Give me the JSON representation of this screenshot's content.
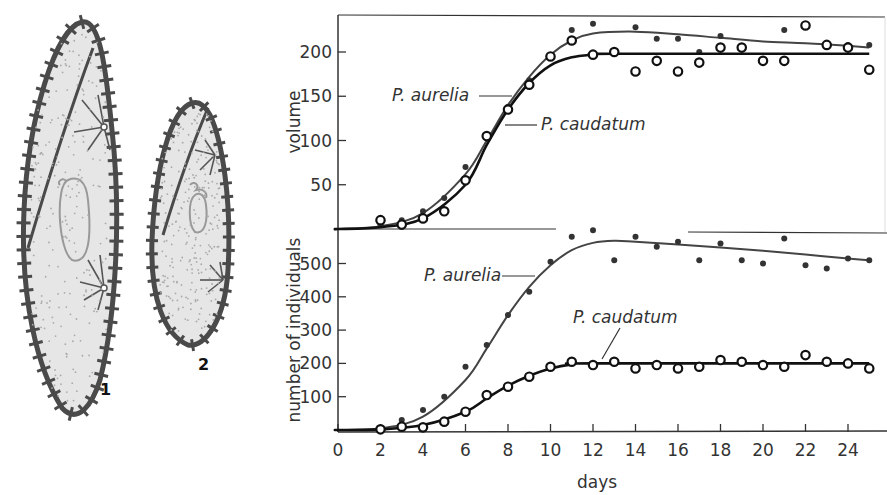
{
  "figure": {
    "organisms": [
      {
        "number_label": "1",
        "name": "P. caudatum (larger)"
      },
      {
        "number_label": "2",
        "name": "P. aurelia (smaller)"
      }
    ],
    "colors": {
      "aurelia_line": "#444444",
      "caudatum_line": "#111111",
      "axis": "#333333",
      "cell_fill": "#e4e4e4",
      "cell_outline": "#4a4a4a"
    }
  },
  "chart_data": [
    {
      "type": "line",
      "panel": "top",
      "title": "",
      "xlabel": "",
      "ylabel": "volume",
      "yticks": [
        50,
        100,
        150,
        200
      ],
      "xlim": [
        0,
        25.5
      ],
      "ylim": [
        0,
        240
      ],
      "grid": false,
      "series": [
        {
          "name": "P. aurelia",
          "marker": "filled-dot",
          "x": [
            2,
            3,
            4,
            5,
            6,
            7,
            8,
            9,
            10,
            11,
            12,
            14,
            15,
            16,
            17,
            18,
            19,
            21,
            22,
            24,
            25
          ],
          "values": [
            5,
            10,
            20,
            35,
            70,
            105,
            138,
            168,
            195,
            225,
            232,
            228,
            215,
            215,
            200,
            218,
            205,
            225,
            230,
            208,
            208
          ],
          "fit_curve": {
            "x": [
              0,
              2,
              4,
              6,
              7,
              8,
              9,
              10,
              11,
              12,
              14,
              16,
              18,
              20,
              22,
              24,
              25
            ],
            "y": [
              0,
              3,
              18,
              62,
              100,
              140,
              172,
              197,
              213,
              221,
              223,
              220,
              216,
              212,
              210,
              207,
              205
            ]
          }
        },
        {
          "name": "P. caudatum",
          "marker": "open-circle",
          "x": [
            2,
            3,
            4,
            5,
            6,
            7,
            8,
            9,
            10,
            11,
            12,
            13,
            14,
            15,
            16,
            17,
            18,
            19,
            20,
            21,
            22,
            23,
            24,
            25
          ],
          "values": [
            10,
            5,
            12,
            20,
            55,
            105,
            135,
            163,
            195,
            213,
            197,
            200,
            178,
            190,
            178,
            188,
            205,
            205,
            190,
            190,
            230,
            208,
            205,
            180
          ],
          "fit_curve": {
            "x": [
              0,
              2,
              4,
              6,
              7,
              8,
              9,
              10,
              11,
              12,
              13,
              25
            ],
            "y": [
              0,
              2,
              12,
              50,
              95,
              135,
              165,
              185,
              194,
              197,
              198,
              198
            ]
          }
        }
      ]
    },
    {
      "type": "line",
      "panel": "bottom",
      "title": "",
      "xlabel": "days",
      "ylabel": "number of individuals",
      "xticks": [
        0,
        2,
        4,
        6,
        8,
        10,
        12,
        14,
        16,
        18,
        20,
        22,
        24
      ],
      "yticks": [
        100,
        200,
        300,
        400,
        500
      ],
      "xlim": [
        0,
        25.5
      ],
      "ylim": [
        0,
        600
      ],
      "grid": false,
      "series": [
        {
          "name": "P. aurelia",
          "marker": "filled-dot",
          "x": [
            2,
            3,
            4,
            5,
            6,
            7,
            8,
            9,
            10,
            11,
            12,
            13,
            14,
            15,
            16,
            17,
            18,
            19,
            20,
            21,
            22,
            23,
            24,
            25
          ],
          "values": [
            5,
            30,
            60,
            100,
            190,
            255,
            345,
            415,
            505,
            580,
            600,
            510,
            580,
            550,
            565,
            510,
            560,
            510,
            500,
            575,
            495,
            485,
            515,
            510
          ],
          "fit_curve": {
            "x": [
              0,
              2,
              4,
              6,
              7,
              8,
              9,
              10,
              11,
              12,
              13,
              14,
              16,
              18,
              20,
              22,
              24,
              25
            ],
            "y": [
              0,
              5,
              40,
              150,
              245,
              345,
              430,
              495,
              540,
              562,
              568,
              565,
              557,
              548,
              538,
              527,
              515,
              510
            ]
          }
        },
        {
          "name": "P. caudatum",
          "marker": "open-circle",
          "x": [
            2,
            3,
            4,
            5,
            6,
            7,
            8,
            9,
            10,
            11,
            12,
            13,
            14,
            15,
            16,
            17,
            18,
            19,
            20,
            21,
            22,
            23,
            24,
            25
          ],
          "values": [
            2,
            10,
            8,
            25,
            55,
            105,
            130,
            160,
            190,
            205,
            195,
            205,
            185,
            195,
            185,
            190,
            210,
            205,
            195,
            190,
            225,
            205,
            200,
            185
          ],
          "fit_curve": {
            "x": [
              0,
              2,
              4,
              6,
              7,
              8,
              9,
              10,
              11,
              12,
              25
            ],
            "y": [
              0,
              2,
              15,
              55,
              95,
              133,
              163,
              185,
              197,
              200,
              200
            ]
          }
        }
      ]
    }
  ],
  "labels": {
    "top_ylabel": "volume",
    "bottom_ylabel": "number of individuals",
    "xlabel": "days",
    "aurelia": "P. aurelia",
    "caudatum": "P. caudatum",
    "top_yticks": [
      "50",
      "100",
      "150",
      "200"
    ],
    "bottom_yticks": [
      "100",
      "200",
      "300",
      "400",
      "500"
    ],
    "xticks": [
      "0",
      "2",
      "4",
      "6",
      "8",
      "10",
      "12",
      "14",
      "16",
      "18",
      "20",
      "22",
      "24"
    ],
    "cell1": "1",
    "cell2": "2"
  }
}
